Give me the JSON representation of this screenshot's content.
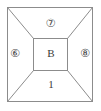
{
  "figure": {
    "name": "frustum-region-diagram",
    "background_color": "#ffffff",
    "stroke_color": "#8c8c8c",
    "stroke_width": 1,
    "outer_rect": {
      "x": 7,
      "y": 7,
      "width": 86,
      "height": 95
    },
    "inner_rect": {
      "x": 33,
      "y": 38,
      "width": 35,
      "height": 33
    },
    "regions": {
      "top_label": "⑦",
      "left_label": "⑥",
      "right_label": "⑧",
      "center_label": "B",
      "bottom_label": "1"
    },
    "diagonals": [
      {
        "name": "top-left-diagonal",
        "x1": 7,
        "y1": 7,
        "x2": 33,
        "y2": 38
      },
      {
        "name": "top-right-diagonal",
        "x1": 93,
        "y1": 7,
        "x2": 68,
        "y2": 38
      },
      {
        "name": "bottom-left-diagonal",
        "x1": 7,
        "y1": 102,
        "x2": 33,
        "y2": 71
      },
      {
        "name": "bottom-right-diagonal",
        "x1": 93,
        "y1": 102,
        "x2": 68,
        "y2": 71
      }
    ]
  }
}
